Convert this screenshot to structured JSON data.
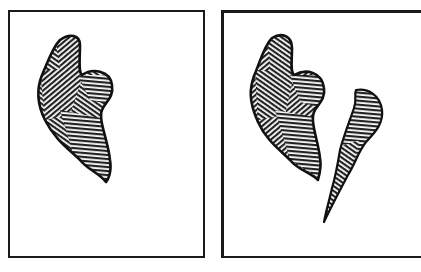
{
  "figure": {
    "panels": [
      {
        "id": "panel-1",
        "shapes": [
          "heart-shaped hatched blob"
        ]
      },
      {
        "id": "panel-2",
        "shapes": [
          "heart-shaped hatched blob",
          "thin curved hatched sliver"
        ]
      }
    ],
    "colors": {
      "ink": "#1a1a1a",
      "paper": "#ffffff"
    }
  }
}
